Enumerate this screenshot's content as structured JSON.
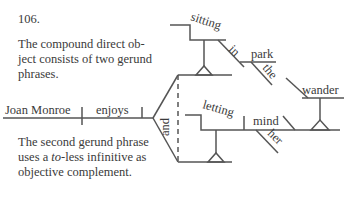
{
  "exercise_number": "106.",
  "note_top": "The compound direct object consists of two gerund phrases.",
  "note_top_lines": [
    "The compound direct ob-",
    "ject consists of two gerund",
    "phrases."
  ],
  "note_bottom_lines_pre": "The second gerund phrase",
  "note_bottom_line2_prefix": "uses a ",
  "note_bottom_line2_italic": "to",
  "note_bottom_line2_suffix": "-less infinitive as",
  "note_bottom_line3": "objective complement.",
  "diagram": {
    "subject": "Joan Monroe",
    "verb": "enjoys",
    "conjunction": "and",
    "gerund1": "sitting",
    "gerund1_prep": "in",
    "gerund1_prep_object": "park",
    "gerund1_prep_object_modifier": "the",
    "gerund2": "letting",
    "gerund2_object": "mind",
    "gerund2_object_modifier": "her",
    "gerund2_objective_complement": "wander"
  }
}
